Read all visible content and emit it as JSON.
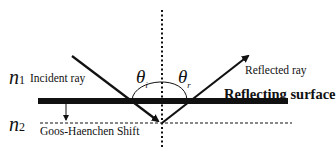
{
  "diagram": {
    "medium1": {
      "symbol": "n",
      "subscript": "1"
    },
    "medium2": {
      "symbol": "n",
      "subscript": "2"
    },
    "incident_label": "Incident ray",
    "reflected_label": "Reflected ray",
    "surface_label": "Reflecting surface",
    "shift_label": "Goos-Haenchen Shift",
    "angle_incident": {
      "symbol": "θ",
      "subscript": "i"
    },
    "angle_reflected": {
      "symbol": "θ",
      "subscript": "r"
    }
  },
  "colors": {
    "ink": "#111111",
    "background": "#ffffff"
  }
}
